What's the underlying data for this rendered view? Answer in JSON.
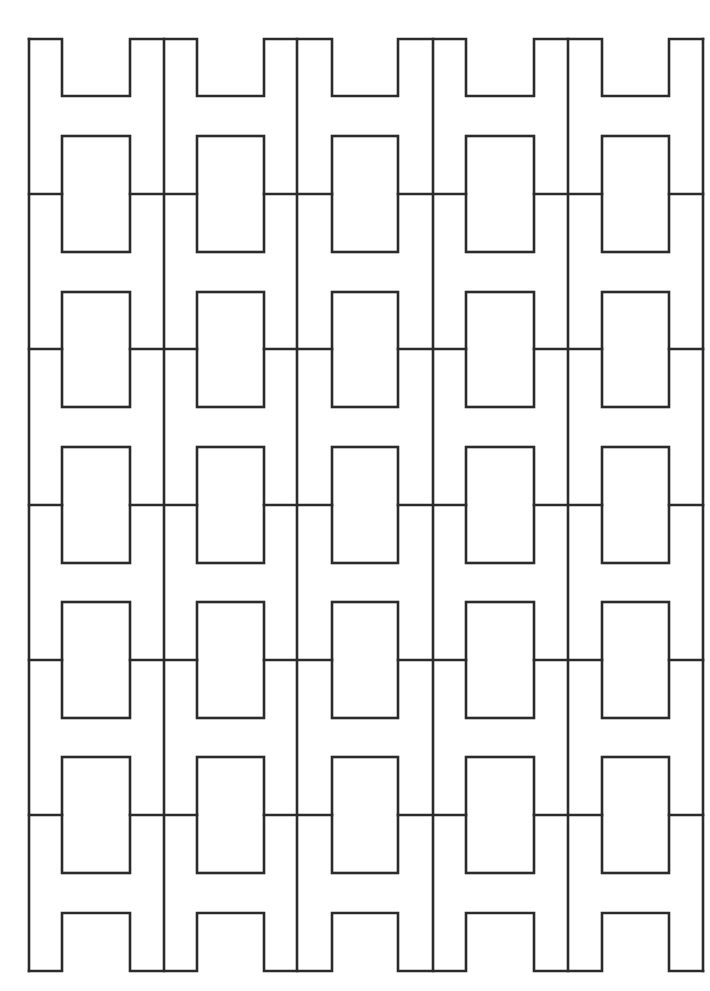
{
  "diagram": {
    "title": "",
    "stroke_color": "#2b2b2b",
    "background_color": "#ffffff",
    "frame": {
      "left": 29,
      "top": 39,
      "right": 703,
      "bottom": 971
    },
    "column_dividers_x": [
      164,
      297,
      433,
      568
    ],
    "columns": [
      {
        "left": 62,
        "right": 130
      },
      {
        "left": 197,
        "right": 264
      },
      {
        "left": 332,
        "right": 398
      },
      {
        "left": 466,
        "right": 534
      },
      {
        "left": 602,
        "right": 669
      }
    ],
    "top_notch_bottom_y": 96,
    "bottom_notch_top_y": 913,
    "rows": [
      {
        "line_y": 194,
        "rect_top": 136,
        "rect_bottom": 252
      },
      {
        "line_y": 349,
        "rect_top": 292,
        "rect_bottom": 407
      },
      {
        "line_y": 505,
        "rect_top": 447,
        "rect_bottom": 563
      },
      {
        "line_y": 660,
        "rect_top": 602,
        "rect_bottom": 718
      },
      {
        "line_y": 815,
        "rect_top": 757,
        "rect_bottom": 873
      }
    ]
  }
}
